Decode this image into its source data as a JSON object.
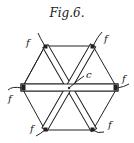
{
  "figure": {
    "title": "Fig.6.",
    "labels": {
      "center": "c",
      "f1": "f",
      "f2": "f",
      "f3": "f",
      "f4": "f",
      "f5": "f",
      "f6": "f"
    }
  },
  "colors": {
    "ink": "#222222",
    "paper": "#ffffff"
  }
}
